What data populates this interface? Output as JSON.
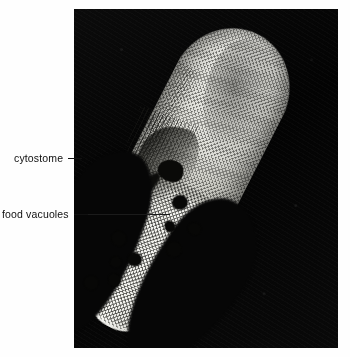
{
  "figure": {
    "kind": "light-micrograph",
    "background_color": "#fefefe",
    "plate_color": "#050505",
    "cell_color": "#ececE6",
    "vacuole_color": "#070706",
    "leader_color": "#111111"
  },
  "annotations": [
    {
      "id": "cytostome",
      "label": "cytostome",
      "label_x": 14,
      "label_y": 153,
      "leader_length": 14,
      "leader_in_plate_length": 0,
      "points_to": "oral-groove"
    },
    {
      "id": "food-vacuoles",
      "label": "food vacuoles",
      "label_x": 2,
      "label_y": 209,
      "leader_length": 14,
      "leader_in_plate_length": 96,
      "points_to": "food-vacuole-cluster"
    }
  ],
  "plate": {
    "x": 74,
    "y": 9,
    "width": 264,
    "height": 339
  },
  "organism": {
    "rotation_deg": 27,
    "x": 52,
    "y": 8,
    "width": 118,
    "height": 322,
    "anterior": "upper-right",
    "posterior": "lower-left"
  },
  "food_vacuoles": [
    {
      "x": 58,
      "y": 178,
      "w": 15,
      "h": 14
    },
    {
      "x": 84,
      "y": 196,
      "w": 13,
      "h": 12
    },
    {
      "x": 62,
      "y": 206,
      "w": 11,
      "h": 10
    },
    {
      "x": 74,
      "y": 222,
      "w": 15,
      "h": 15
    },
    {
      "x": 20,
      "y": 238,
      "w": 15,
      "h": 14
    },
    {
      "x": 44,
      "y": 250,
      "w": 14,
      "h": 13
    },
    {
      "x": 30,
      "y": 262,
      "w": 11,
      "h": 11
    },
    {
      "x": 36,
      "y": 278,
      "w": 13,
      "h": 12
    },
    {
      "x": 16,
      "y": 290,
      "w": 14,
      "h": 14
    }
  ]
}
